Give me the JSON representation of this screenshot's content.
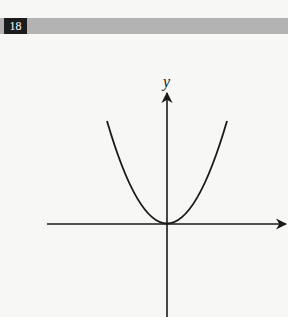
{
  "header": {
    "page_number": "18",
    "bar_color": "#b3b3b3",
    "badge_color": "#1c1c1c"
  },
  "figure": {
    "type": "parabola",
    "equation_shape": "y = kx^2 (opens upward, vertex at origin)",
    "y_axis_label": "y",
    "x_axis_label": "",
    "line_color": "#1a1a1a"
  }
}
